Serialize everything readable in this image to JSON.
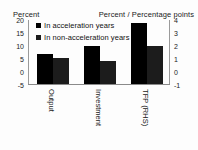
{
  "chart_data": {
    "type": "bar",
    "title": "",
    "subtitle": "",
    "categories": [
      "Output",
      "Investment",
      "TFP (RHS)"
    ],
    "series": [
      {
        "name": "In acceleration years",
        "values": [
          6.8,
          10.0,
          3.8
        ]
      },
      {
        "name": "In non-acceleration years",
        "values": [
          5.2,
          4.2,
          2.0
        ]
      }
    ],
    "left_axis": {
      "label": "Percent",
      "ticks": [
        "20",
        "15",
        "10",
        "5",
        "0",
        "-5"
      ],
      "tick_values": [
        20,
        15,
        10,
        5,
        0,
        -5
      ],
      "ylim": [
        -5,
        20
      ]
    },
    "right_axis": {
      "label": "Percent / Percentage points",
      "ticks": [
        "4",
        "3",
        "2",
        "1",
        "0",
        "-1"
      ],
      "tick_values": [
        4,
        3,
        2,
        1,
        0,
        -1
      ],
      "ylim": [
        -1,
        4
      ]
    },
    "axis_assignment": [
      "left",
      "left",
      "right"
    ],
    "legend": {
      "position": "top-left",
      "entries": [
        "In acceleration years",
        "In non-acceleration years"
      ]
    },
    "grid": false,
    "colors": {
      "series_0": "#000000",
      "series_1": "#1c1c1c",
      "axis": "#8a8a8a",
      "text": "#1a1a1a",
      "background": "#fdfdfd"
    }
  }
}
